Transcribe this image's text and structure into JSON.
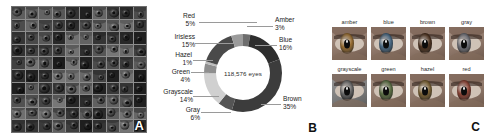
{
  "figure": {
    "background": "#ffffff"
  },
  "chart_data": {
    "type": "pie",
    "title": "",
    "center_label": "118,576 eyes",
    "total_eyes": 118576,
    "legend_position": "callout-labels",
    "grid": false,
    "categories": [
      "Amber",
      "Blue",
      "Brown",
      "Gray",
      "Grayscale",
      "Green",
      "Hazel",
      "Irisless",
      "Red"
    ],
    "values": [
      3,
      16,
      35,
      6,
      14,
      4,
      1,
      15,
      5
    ],
    "unit": "%",
    "slices": [
      {
        "label": "Amber",
        "pct": "3%",
        "value": 3,
        "color": "#6d6d6d",
        "side": "right"
      },
      {
        "label": "Blue",
        "pct": "16%",
        "value": 16,
        "color": "#2e2e2e",
        "side": "right"
      },
      {
        "label": "Brown",
        "pct": "35%",
        "value": 35,
        "color": "#3c3c3c",
        "side": "right"
      },
      {
        "label": "Gray",
        "pct": "6%",
        "value": 6,
        "color": "#555555",
        "side": "left"
      },
      {
        "label": "Grayscale",
        "pct": "14%",
        "value": 14,
        "color": "#d0d0d0",
        "side": "left"
      },
      {
        "label": "Green",
        "pct": "4%",
        "value": 4,
        "color": "#8e8e8e",
        "side": "left"
      },
      {
        "label": "Hazel",
        "pct": "1%",
        "value": 1,
        "color": "#bcbcbc",
        "side": "left"
      },
      {
        "label": "Irisless",
        "pct": "15%",
        "value": 15,
        "color": "#4a4a4a",
        "side": "left"
      },
      {
        "label": "Red",
        "pct": "5%",
        "value": 5,
        "color": "#9b9b9b",
        "side": "left"
      }
    ]
  },
  "panel_a": {
    "letter": "A",
    "caption": "",
    "grid_rows": 10,
    "grid_cols": 10,
    "tile_count": 100
  },
  "panel_b": {
    "letter": "B"
  },
  "panel_c": {
    "letter": "C",
    "examples": [
      {
        "caption": "amber",
        "iris_color": "#9a6f33"
      },
      {
        "caption": "blue",
        "iris_color": "#4a6a85"
      },
      {
        "caption": "brown",
        "iris_color": "#4e3320"
      },
      {
        "caption": "gray",
        "iris_color": "#70727a"
      },
      {
        "caption": "grayscale",
        "iris_color": "#6a6a6a"
      },
      {
        "caption": "green",
        "iris_color": "#5e7247"
      },
      {
        "caption": "hazel",
        "iris_color": "#7b6234"
      },
      {
        "caption": "red",
        "iris_color": "#8d4436"
      }
    ]
  }
}
